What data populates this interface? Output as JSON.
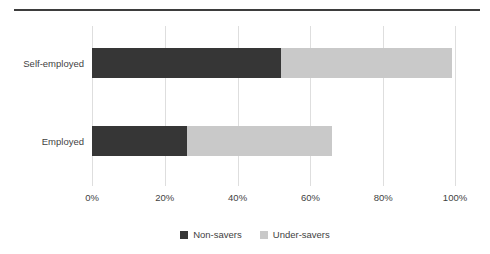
{
  "figure": {
    "has_top_rule": true,
    "background": "#ffffff"
  },
  "chart_data": {
    "type": "bar",
    "orientation": "horizontal",
    "stacked": true,
    "stack_mode": "absolute-percent",
    "title": "",
    "subtitle": "",
    "xlabel": "",
    "ylabel": "",
    "categories": [
      "Self-employed",
      "Employed"
    ],
    "series": [
      {
        "name": "Non-savers",
        "color": "#363636",
        "values": [
          52,
          26
        ]
      },
      {
        "name": "Under-savers",
        "color": "#c9c9c9",
        "values": [
          47,
          40
        ]
      }
    ],
    "totals": [
      99,
      66
    ],
    "xlim": [
      0,
      100
    ],
    "xticks": [
      0,
      20,
      40,
      60,
      80,
      100
    ],
    "xtick_labels": [
      "0%",
      "20%",
      "40%",
      "60%",
      "80%",
      "100%"
    ],
    "grid": {
      "vertical": true,
      "horizontal": false,
      "color": "#dedede"
    },
    "legend": {
      "position": "bottom-center",
      "entries": [
        {
          "label": "Non-savers",
          "color": "#363636"
        },
        {
          "label": "Under-savers",
          "color": "#c9c9c9"
        }
      ]
    }
  }
}
